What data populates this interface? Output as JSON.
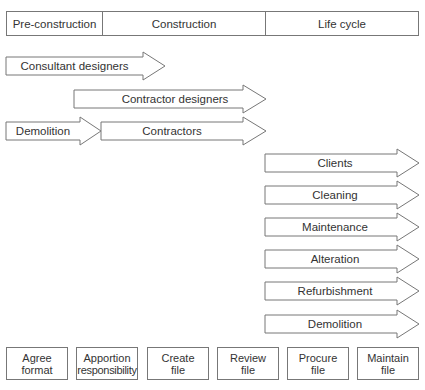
{
  "phases": [
    {
      "label": "Pre-construction"
    },
    {
      "label": "Construction"
    },
    {
      "label": "Life cycle"
    }
  ],
  "arrows": [
    {
      "label": "Consultant designers"
    },
    {
      "label": "Contractor designers"
    },
    {
      "label": "Demolition"
    },
    {
      "label": "Contractors"
    },
    {
      "label": "Clients"
    },
    {
      "label": "Cleaning"
    },
    {
      "label": "Maintenance"
    },
    {
      "label": "Alteration"
    },
    {
      "label": "Refurbishment"
    },
    {
      "label": "Demolition"
    }
  ],
  "tasks": [
    {
      "line1": "Agree",
      "line2": "format"
    },
    {
      "line1": "Apportion",
      "line2": "responsibility"
    },
    {
      "line1": "Create",
      "line2": "file"
    },
    {
      "line1": "Review",
      "line2": "file"
    },
    {
      "line1": "Procure",
      "line2": "file"
    },
    {
      "line1": "Maintain",
      "line2": "file"
    }
  ],
  "colors": {
    "stroke": "#777777",
    "text": "#333333",
    "background": "#ffffff"
  }
}
